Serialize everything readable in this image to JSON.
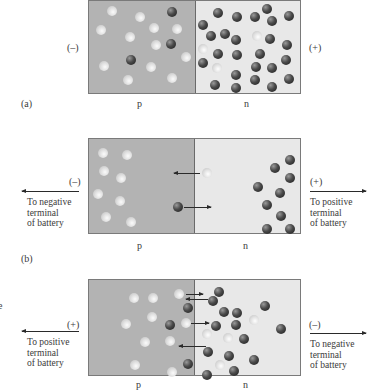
{
  "panel_a": {
    "label": "(a)",
    "left_terminal": "(–)",
    "right_terminal": "(+)",
    "p_label": "p",
    "n_label": "n"
  },
  "panel_b": {
    "label": "(b)",
    "left_terminal": "(–)",
    "right_terminal": "(+)",
    "left_caption": "To negative\nterminal\nof battery",
    "right_caption": "To positive\nterminal\nof battery",
    "p_label": "p",
    "n_label": "n"
  },
  "panel_c": {
    "left_terminal": "(+)",
    "right_terminal": "(–)",
    "left_caption": "To positive\nterminal\nof battery",
    "right_caption": "To negative\nterminal\nof battery",
    "p_label": "p",
    "n_label": "n"
  },
  "cropped_fragment": "e",
  "legend": {
    "electron": "dark sphere (electron)",
    "hole": "light sphere (hole)"
  },
  "colors": {
    "p_region": "#b3b3b3",
    "n_region": "#e8e8e8",
    "border": "#7a7a7a"
  }
}
